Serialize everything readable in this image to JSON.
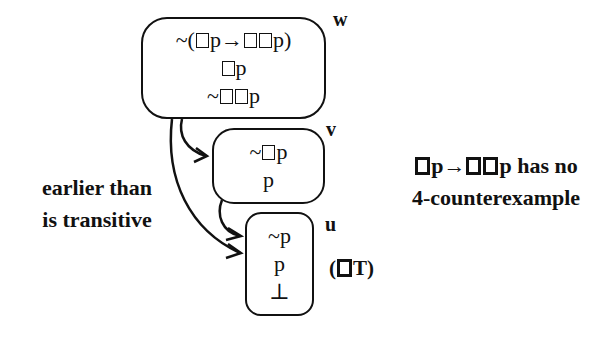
{
  "diagram": {
    "worlds": [
      {
        "id": "w",
        "label": "w",
        "formulas": [
          "~(□p→□□p)",
          "□p",
          "~□□p"
        ]
      },
      {
        "id": "v",
        "label": "v",
        "formulas": [
          "~□p",
          "p"
        ]
      },
      {
        "id": "u",
        "label": "u",
        "formulas": [
          "~p",
          "p",
          "⊥"
        ]
      }
    ],
    "arrows": [
      {
        "from": "w",
        "to": "v"
      },
      {
        "from": "v",
        "to": "u"
      },
      {
        "from": "w",
        "to": "u"
      }
    ],
    "rule_label": "(□T)",
    "left_note": [
      "earlier than",
      "is transitive"
    ],
    "right_note": [
      "□p→□□p has no",
      "4-counterexample"
    ]
  },
  "colors": {
    "ink": "#111111",
    "background": "#ffffff"
  }
}
